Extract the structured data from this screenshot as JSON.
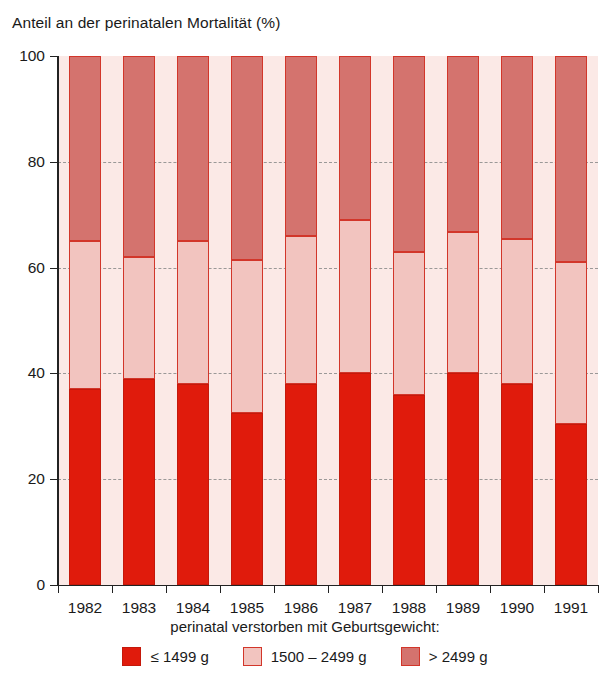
{
  "chart_data": {
    "type": "bar",
    "subtype": "stacked-100-percent",
    "title": "Anteil an der perinatalen Mortalität (%)",
    "xlabel": "",
    "ylabel": "",
    "ylim": [
      0,
      100
    ],
    "yticks": [
      0,
      20,
      40,
      60,
      80,
      100
    ],
    "grid": true,
    "legend_position": "bottom",
    "legend_caption": "perinatal verstorben mit Geburtsgewicht:",
    "categories": [
      "1982",
      "1983",
      "1984",
      "1985",
      "1986",
      "1987",
      "1988",
      "1989",
      "1990",
      "1991"
    ],
    "series": [
      {
        "name": "≤ 1499 g",
        "color": "#e01b0c",
        "values": [
          37,
          39,
          38,
          32.5,
          38,
          40,
          36,
          40,
          38,
          30.5
        ]
      },
      {
        "name": "1500 – 2499 g",
        "color": "#f2c4bf",
        "values": [
          28,
          23,
          27,
          29,
          28,
          29,
          27,
          26.7,
          27.5,
          30.5
        ]
      },
      {
        "name": "> 2499 g",
        "color": "#d4736e",
        "values": [
          35,
          38,
          35,
          38.5,
          34,
          31,
          37,
          33.3,
          34.5,
          39
        ]
      }
    ],
    "cumulative_upper_bounds": [
      [
        37,
        65,
        100
      ],
      [
        39,
        62,
        100
      ],
      [
        38,
        65,
        100
      ],
      [
        32.5,
        61.5,
        100
      ],
      [
        38,
        66,
        100
      ],
      [
        40,
        69,
        100
      ],
      [
        36,
        63,
        100
      ],
      [
        40,
        66.7,
        100
      ],
      [
        38,
        65.5,
        100
      ],
      [
        30.5,
        61,
        100
      ]
    ]
  },
  "colors": {
    "low": "#e01b0c",
    "mid": "#f2c4bf",
    "high": "#d4736e",
    "plot_background": "#fbe9e6",
    "axis": "#222222"
  }
}
